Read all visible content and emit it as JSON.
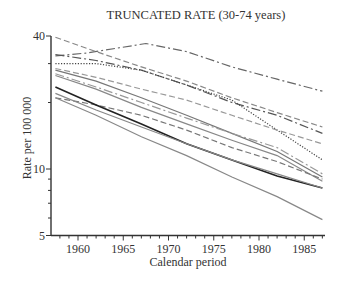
{
  "chart_data": {
    "type": "line",
    "title": "TRUNCATED RATE (30-74 years)",
    "xlabel": "Calendar period",
    "ylabel": "Rate per 100 000",
    "y_scale": "log",
    "ylim": [
      5,
      40
    ],
    "xlim": [
      1957,
      1987.5
    ],
    "x_ticks": [
      1960,
      1965,
      1970,
      1975,
      1980,
      1985
    ],
    "y_ticks": [
      5,
      10,
      40
    ],
    "grid": false,
    "legend": "none",
    "series": [
      {
        "name": "series-1 (dash-dot, top)",
        "style": "dashdot",
        "color": "#666666",
        "x": [
          1957.5,
          1961,
          1967.5,
          1972,
          1977,
          1982,
          1987
        ],
        "values": [
          32.5,
          33.5,
          37,
          34,
          29,
          25.5,
          22.5
        ]
      },
      {
        "name": "series-2 (dashed)",
        "style": "dashed",
        "color": "#888888",
        "x": [
          1957.5,
          1962,
          1967,
          1972,
          1977,
          1982,
          1987
        ],
        "values": [
          39.5,
          34,
          29,
          25,
          21,
          18,
          15.5
        ]
      },
      {
        "name": "series-3 (dash-dot)",
        "style": "dashdot",
        "color": "#555555",
        "x": [
          1957.5,
          1962,
          1967,
          1972,
          1977,
          1982,
          1987
        ],
        "values": [
          33,
          31,
          28,
          24,
          20,
          17.5,
          14.5
        ]
      },
      {
        "name": "series-4 (dotted)",
        "style": "dotted",
        "color": "#444444",
        "x": [
          1957.5,
          1962,
          1967,
          1972,
          1977,
          1982,
          1987
        ],
        "values": [
          30,
          30,
          28,
          24,
          20.5,
          15,
          11
        ]
      },
      {
        "name": "series-5 (dashed light)",
        "style": "dashed",
        "color": "#999999",
        "x": [
          1957.5,
          1962,
          1967,
          1972,
          1977,
          1982,
          1987
        ],
        "values": [
          28.5,
          26,
          23,
          20.5,
          17.5,
          15,
          13
        ]
      },
      {
        "name": "series-6 (solid grey)",
        "style": "solid",
        "color": "#777777",
        "x": [
          1957.5,
          1962,
          1967,
          1972,
          1977,
          1982,
          1987
        ],
        "values": [
          28,
          25,
          21,
          17.5,
          14.5,
          12,
          9.2
        ]
      },
      {
        "name": "series-7 (dash-dot light)",
        "style": "dashdot",
        "color": "#999999",
        "x": [
          1957.5,
          1962,
          1967,
          1972,
          1977,
          1982,
          1987
        ],
        "values": [
          27,
          23.5,
          20,
          17,
          14.5,
          12.5,
          9.5
        ]
      },
      {
        "name": "series-8 (solid grey 2)",
        "style": "solid",
        "color": "#888888",
        "x": [
          1957.5,
          1962,
          1967,
          1972,
          1977,
          1982,
          1987
        ],
        "values": [
          26.5,
          23,
          19,
          16,
          13.5,
          11.5,
          8.8
        ]
      },
      {
        "name": "series-9 (dashed 2)",
        "style": "dashed",
        "color": "#777777",
        "x": [
          1957.5,
          1962,
          1967,
          1972,
          1977,
          1982,
          1987
        ],
        "values": [
          21,
          19.5,
          17.5,
          15,
          12.5,
          10.8,
          9
        ]
      },
      {
        "name": "series-10 (solid black)",
        "style": "solid",
        "color": "#222222",
        "x": [
          1957.5,
          1962,
          1967,
          1972,
          1977,
          1982,
          1987
        ],
        "values": [
          23.5,
          19.5,
          16,
          13,
          11,
          9.3,
          8.2
        ]
      },
      {
        "name": "series-11 (solid grey 3)",
        "style": "solid",
        "color": "#888888",
        "x": [
          1957.5,
          1962,
          1967,
          1972,
          1977,
          1982,
          1987
        ],
        "values": [
          22,
          18.5,
          15.5,
          13,
          11,
          9.5,
          8.2
        ]
      },
      {
        "name": "series-12 (solid bottom)",
        "style": "solid",
        "color": "#888888",
        "x": [
          1957.5,
          1962,
          1967,
          1972,
          1977,
          1982,
          1987
        ],
        "values": [
          21,
          17.5,
          14,
          11.5,
          9.2,
          7.5,
          5.9
        ]
      }
    ]
  }
}
